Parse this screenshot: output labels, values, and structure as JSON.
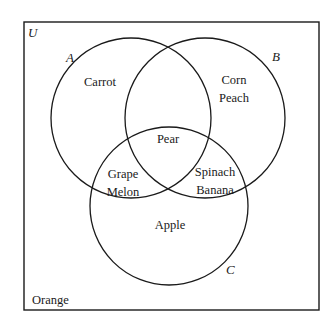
{
  "universe": {
    "label": "U",
    "outside": [
      "Orange"
    ]
  },
  "sets": [
    {
      "name": "A",
      "only": [
        "Carrot"
      ]
    },
    {
      "name": "B",
      "only": [
        "Corn",
        "Peach"
      ]
    },
    {
      "name": "C",
      "only": [
        "Apple"
      ]
    }
  ],
  "regions": {
    "a_only": [
      "Carrot"
    ],
    "b_only": [
      "Corn",
      "Peach"
    ],
    "c_only": [
      "Apple"
    ],
    "a_b_c": [
      "Pear"
    ],
    "a_c_only": [
      "Grape",
      "Melon"
    ],
    "b_c_only": [
      "Spinach",
      "Banana"
    ],
    "a_b_only": [],
    "outside": [
      "Orange"
    ]
  },
  "colors": {
    "stroke": "#1a1a1a",
    "background": "#ffffff"
  }
}
